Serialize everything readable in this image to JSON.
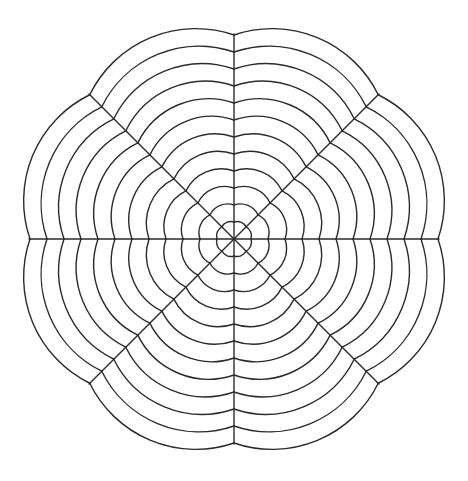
{
  "page": {
    "background_color": "#ffffff",
    "width": 468,
    "height": 481
  },
  "header": {
    "faint_text": "· · ·   ·  ·",
    "note": "cut-off page header remnant along top edge"
  },
  "figure": {
    "name": "mandala-line-drawing",
    "stroke_color": "#2b2b2b",
    "stroke_width": 1.4,
    "fill_color": "none"
  },
  "chart_data": {
    "type": "scatter",
    "xlabel": "",
    "ylabel": "",
    "grid": false,
    "legend": "none",
    "xlim": [
      0,
      468
    ],
    "ylim": [
      0,
      481
    ],
    "center": {
      "x": 234,
      "y": 239
    },
    "sector_count": 8,
    "sector_angle_deg": 45,
    "spoke_angles_deg": [
      0,
      45,
      90,
      135,
      180,
      225,
      270,
      315
    ],
    "spoke_radius": 205,
    "arc_count_per_sector": 12,
    "arc_radii": [
      17,
      34,
      51,
      68,
      85,
      102,
      119,
      136,
      153,
      170,
      187,
      204
    ],
    "arc_spacing": 17,
    "extent": {
      "left": 28,
      "right": 440,
      "top": 33,
      "bottom": 445
    }
  }
}
